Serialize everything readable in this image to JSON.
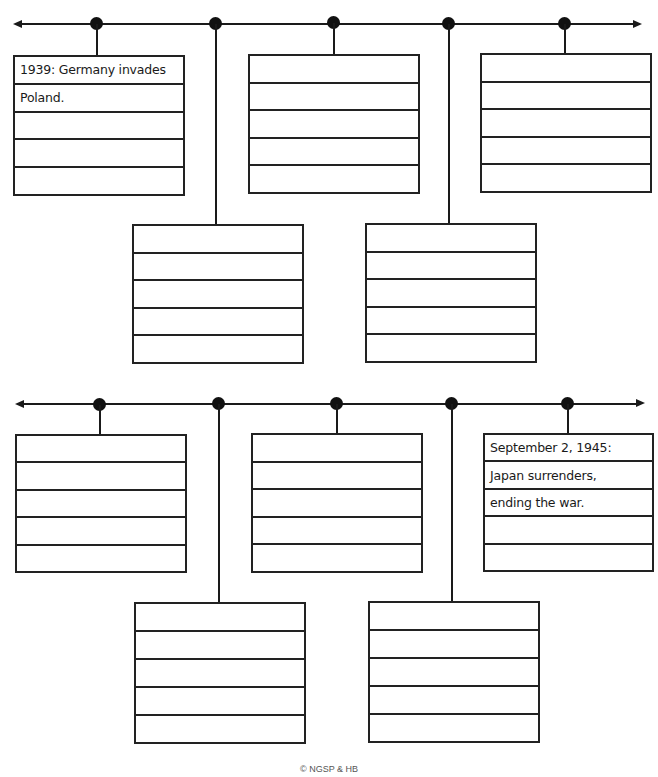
{
  "timelines": [
    {
      "name": "timeline-1",
      "events": [
        {
          "position": "above-left",
          "lines": [
            "1939: Germany invades",
            "Poland.",
            "",
            "",
            ""
          ]
        },
        {
          "position": "below",
          "lines": [
            "",
            "",
            "",
            "",
            ""
          ]
        },
        {
          "position": "above",
          "lines": [
            "",
            "",
            "",
            "",
            ""
          ]
        },
        {
          "position": "below",
          "lines": [
            "",
            "",
            "",
            "",
            ""
          ]
        },
        {
          "position": "above-right",
          "lines": [
            "",
            "",
            "",
            "",
            ""
          ]
        }
      ]
    },
    {
      "name": "timeline-2",
      "events": [
        {
          "position": "above-left",
          "lines": [
            "",
            "",
            "",
            "",
            ""
          ]
        },
        {
          "position": "below",
          "lines": [
            "",
            "",
            "",
            "",
            ""
          ]
        },
        {
          "position": "above",
          "lines": [
            "",
            "",
            "",
            "",
            ""
          ]
        },
        {
          "position": "below",
          "lines": [
            "",
            "",
            "",
            "",
            ""
          ]
        },
        {
          "position": "above-right",
          "lines": [
            "September 2, 1945:",
            "Japan surrenders,",
            "ending the war.",
            "",
            ""
          ]
        }
      ]
    }
  ],
  "footer": {
    "copyright": "© NGSP & HB"
  },
  "colors": {
    "ink": "#1a1a1a",
    "background": "#ffffff"
  }
}
